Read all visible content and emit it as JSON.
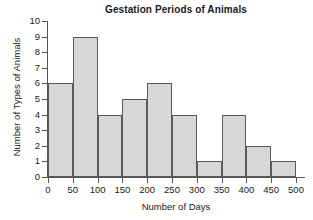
{
  "chart_data": {
    "type": "bar",
    "title": "Gestation Periods of Animals",
    "xlabel": "Number of Days",
    "ylabel": "Number of Types of Animals",
    "bin_width": 50,
    "bin_edges": [
      0,
      50,
      100,
      150,
      200,
      250,
      300,
      350,
      400,
      450,
      500
    ],
    "categories": [
      "0-50",
      "50-100",
      "100-150",
      "150-200",
      "200-250",
      "250-300",
      "300-350",
      "350-400",
      "400-450",
      "450-500"
    ],
    "values": [
      6,
      9,
      4,
      5,
      6,
      4,
      1,
      4,
      2,
      1
    ],
    "xlim": [
      0,
      500
    ],
    "ylim": [
      0,
      10
    ],
    "xticks": [
      0,
      50,
      100,
      150,
      200,
      250,
      300,
      350,
      400,
      450,
      500
    ],
    "yticks": [
      0,
      1,
      2,
      3,
      4,
      5,
      6,
      7,
      8,
      9,
      10
    ],
    "xtick_labels": [
      "0",
      "50",
      "100",
      "150",
      "200",
      "250",
      "300",
      "350",
      "400",
      "450",
      "500"
    ],
    "ytick_labels": [
      "0",
      "1",
      "2",
      "3",
      "4",
      "5",
      "6",
      "7",
      "8",
      "9",
      "10"
    ],
    "grid": false,
    "legend": null,
    "bar_fill_color": "#d7d7d7",
    "bar_edge_color": "#5a5a5a",
    "axis_color": "#555555",
    "text_color": "#1a1a1a"
  }
}
